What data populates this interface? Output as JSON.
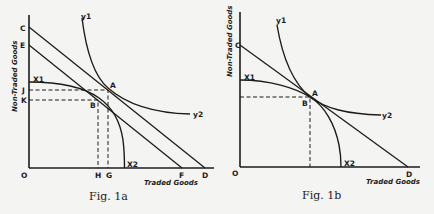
{
  "figures": [
    {
      "id": "fig1a",
      "caption": "Fig. 1a",
      "x_axis_label": "Traded Goods",
      "y_axis_label": "Non-Traded Goods",
      "origin_label": "O",
      "labels": {
        "C": "C",
        "E": "E",
        "J": "J",
        "K": "K",
        "H": "H",
        "G": "G",
        "F": "F",
        "D": "D",
        "A": "A",
        "B": "B",
        "x1": "X1",
        "x2": "X2",
        "y1": "y1",
        "y2": "y2"
      },
      "elements": {
        "budget_lines": [
          "CD",
          "EF"
        ],
        "production_frontier": "X1X2",
        "indifference_curve": "y1y2",
        "points": [
          "A",
          "B"
        ],
        "dashed_guides": [
          "J-A-G",
          "K-B-H"
        ]
      }
    },
    {
      "id": "fig1b",
      "caption": "Fig. 1b",
      "x_axis_label": "Traded Goods",
      "y_axis_label": "Non-Traded Goods",
      "origin_label": "O",
      "labels": {
        "C": "C",
        "D": "D",
        "A": "A",
        "B": "B",
        "x1": "X1",
        "x2": "X2",
        "y1": "y1",
        "y2": "y2"
      },
      "elements": {
        "budget_lines": [
          "CD"
        ],
        "production_frontier": "X1X2",
        "indifference_curve": "y1y2",
        "points": [
          "A",
          "B"
        ],
        "dashed_guides": [
          "A-to-axes"
        ]
      }
    }
  ]
}
